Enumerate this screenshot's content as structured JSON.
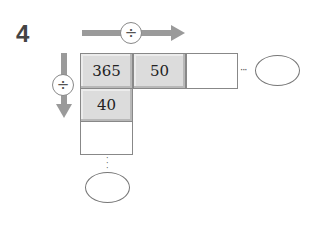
{
  "problem": {
    "number": "4"
  },
  "operators": {
    "horizontal": "÷",
    "vertical": "÷"
  },
  "row": {
    "cells": [
      "365",
      "50",
      ""
    ]
  },
  "column": {
    "cells": [
      "40",
      ""
    ]
  },
  "continuation": {
    "horizontal_dots": "···",
    "vertical_dots": "⋮"
  },
  "answers": {
    "horizontal_answer": "",
    "vertical_answer": ""
  },
  "colors": {
    "arrow": "#9a9a9a",
    "filled_cell": "#dcdcdc",
    "border": "#888888"
  }
}
